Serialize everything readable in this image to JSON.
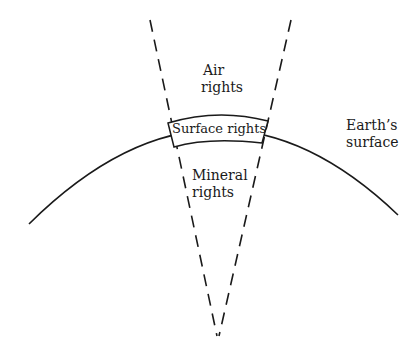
{
  "diagram": {
    "labels": {
      "air_line1": "Air",
      "air_line2": "rights",
      "surface": "Surface rights",
      "mineral_line1": "Mineral",
      "mineral_line2": "rights",
      "earth_line1": "Earth’s",
      "earth_line2": "surface"
    },
    "colors": {
      "stroke": "#1a1a1a",
      "background": "#ffffff"
    }
  }
}
